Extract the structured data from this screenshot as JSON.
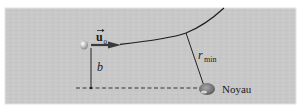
{
  "diagram": {
    "labels": {
      "velocity_vector": "u",
      "velocity_subscript": "0",
      "impact_parameter": "b",
      "min_distance": "r",
      "min_distance_subscript": "min",
      "nucleus": "Noyau"
    },
    "colors": {
      "panel": "#c9c9c9",
      "panel_border": "#e6e6e6",
      "line": "#222222",
      "nucleus": "#8a8a8a",
      "particle": "#b5b5b5"
    }
  }
}
